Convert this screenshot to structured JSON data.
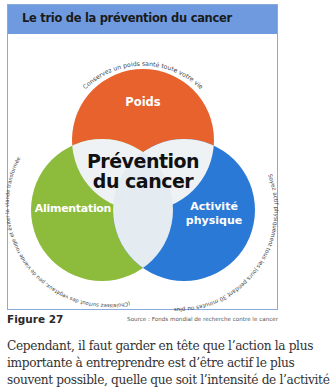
{
  "figure": {
    "title": "Le trio de la prévention du cancer",
    "center_label_line1": "Prévention",
    "center_label_line2": "du cancer",
    "circles": [
      {
        "key": "poids",
        "label": "Poids",
        "color": "#e8622e",
        "arc_text": "Conservez un poids santé toute votre vie"
      },
      {
        "key": "alimentation",
        "label": "Alimentation",
        "color": "#8dbb3b",
        "arc_text": "(Choisissez surtout des végétaux, peu de viande rouge et éviter la viande transformée"
      },
      {
        "key": "activite",
        "label_line1": "Activité",
        "label_line2": "physique",
        "color": "#2a79d6",
        "arc_text": "Soyez actif physiquement tous les jours pendant 30 minutes ou plus"
      }
    ],
    "overlap_color": "#eef2f5",
    "header_color": "#6f9ae0"
  },
  "caption": {
    "figure_number": "Figure 27",
    "source": "Source : Fonds mondial de recherche contre le cancer"
  },
  "body_text": {
    "line1": "Cependant, il faut garder en tête que l’action la plus",
    "line2": "importante à entreprendre est d’être actif le plus",
    "line3": "souvent possible, quelle que soit l’intensité de l’activité"
  }
}
